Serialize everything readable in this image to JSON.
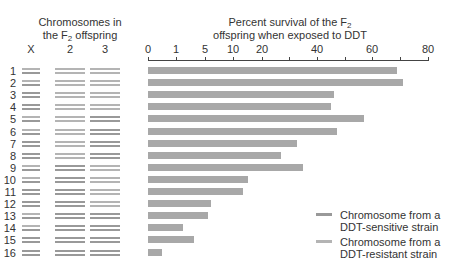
{
  "left_panel": {
    "title_line1": "Chromosomes in",
    "title_line2_pre": "the F",
    "title_line2_sub": "2",
    "title_line2_post": " offspring",
    "columns": [
      "X",
      "2",
      "3"
    ]
  },
  "colors": {
    "sensitive": "#999999",
    "resistant": "#b4b4b4",
    "bar": "#a8a8a8",
    "axis": "#444444",
    "text": "#333333"
  },
  "legend": {
    "items": [
      {
        "line1": "Chromosome from a",
        "line2": "DDT-sensitive strain",
        "key": "sensitive"
      },
      {
        "line1": "Chromosome from a",
        "line2": "DDT-resistant strain",
        "key": "resistant"
      }
    ]
  },
  "chart_data": {
    "type": "bar",
    "orientation": "horizontal",
    "title": "Percent survival of the F2 offspring when exposed to DDT",
    "title_line1_pre": "Percent survival of the F",
    "title_line1_sub": "2",
    "title_line2": "offspring when exposed to DDT",
    "xlabel": "Percent survival",
    "ylabel": "F2 offspring genotype",
    "x_ticks": [
      "0",
      "1",
      "5",
      "10",
      "20",
      "",
      "40",
      "",
      "60",
      "",
      "80"
    ],
    "x_tick_values": [
      0,
      1,
      5,
      10,
      20,
      30,
      40,
      50,
      60,
      70,
      80
    ],
    "xlim": [
      0,
      80
    ],
    "x_scale": "nonlinear (compressed below 20)",
    "grid": false,
    "legend_position": "bottom-right",
    "categories": [
      "1",
      "2",
      "3",
      "4",
      "5",
      "6",
      "7",
      "8",
      "9",
      "10",
      "11",
      "12",
      "13",
      "14",
      "15",
      "16"
    ],
    "values": [
      69,
      71,
      46,
      45,
      57,
      47,
      33,
      27,
      35,
      15,
      13.5,
      6,
      5.5,
      2,
      3.5,
      0.5
    ],
    "genotypes": [
      {
        "X": "R",
        "2": "R",
        "3": "R"
      },
      {
        "X": "R",
        "2": "R",
        "3": "R"
      },
      {
        "X": "S",
        "2": "R",
        "3": "R"
      },
      {
        "X": "S",
        "2": "R",
        "3": "R"
      },
      {
        "X": "R",
        "2": "R",
        "3": "S"
      },
      {
        "X": "R",
        "2": "R",
        "3": "S"
      },
      {
        "X": "S",
        "2": "R",
        "3": "S"
      },
      {
        "X": "S",
        "2": "R",
        "3": "S"
      },
      {
        "X": "R",
        "2": "S",
        "3": "R"
      },
      {
        "X": "R",
        "2": "S",
        "3": "R"
      },
      {
        "X": "S",
        "2": "S",
        "3": "R"
      },
      {
        "X": "S",
        "2": "S",
        "3": "R"
      },
      {
        "X": "R",
        "2": "S",
        "3": "S"
      },
      {
        "X": "R",
        "2": "S",
        "3": "S"
      },
      {
        "X": "S",
        "2": "S",
        "3": "S"
      },
      {
        "X": "S",
        "2": "S",
        "3": "S"
      }
    ]
  }
}
